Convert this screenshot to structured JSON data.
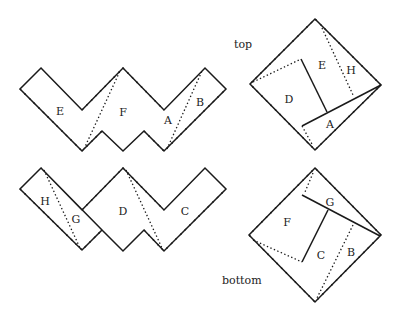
{
  "captions": {
    "top": "top",
    "bottom": "bottom"
  },
  "top_strip": {
    "labels": [
      {
        "text": "E",
        "x": 60,
        "y": 112
      },
      {
        "text": "F",
        "x": 123,
        "y": 113
      },
      {
        "text": "A",
        "x": 168,
        "y": 121
      },
      {
        "text": "B",
        "x": 200,
        "y": 103
      }
    ]
  },
  "bottom_strip": {
    "labels": [
      {
        "text": "H",
        "x": 45,
        "y": 202
      },
      {
        "text": "G",
        "x": 76,
        "y": 220
      },
      {
        "text": "D",
        "x": 123,
        "y": 212
      },
      {
        "text": "C",
        "x": 185,
        "y": 212
      }
    ]
  },
  "top_square": {
    "labels": [
      {
        "text": "E",
        "x": 322,
        "y": 66
      },
      {
        "text": "H",
        "x": 351,
        "y": 71
      },
      {
        "text": "D",
        "x": 289,
        "y": 100
      },
      {
        "text": "A",
        "x": 330,
        "y": 125
      }
    ]
  },
  "bottom_square": {
    "labels": [
      {
        "text": "G",
        "x": 330,
        "y": 203
      },
      {
        "text": "F",
        "x": 287,
        "y": 223
      },
      {
        "text": "C",
        "x": 321,
        "y": 256
      },
      {
        "text": "B",
        "x": 351,
        "y": 253
      }
    ]
  }
}
